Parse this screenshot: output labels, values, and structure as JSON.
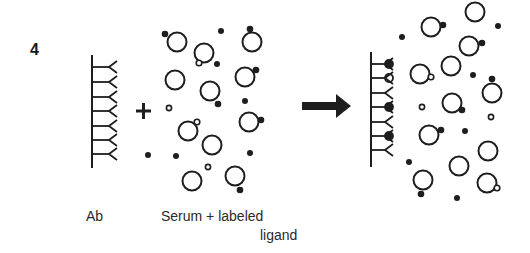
{
  "figure": {
    "panel_number": "4",
    "labels": {
      "antibody": "Ab",
      "serum_line1": "Serum + labeled",
      "serum_line2": "ligand"
    },
    "plus_symbol": "+",
    "arrow": "reaction-arrow",
    "colors": {
      "ink": "#1e1e1e",
      "text": "#2a2a2a",
      "background": "#ffffff"
    }
  },
  "antibody_left": {
    "x": 92,
    "y_top": 55,
    "y_bottom": 168,
    "arms_y": [
      67,
      82,
      97,
      111,
      126,
      140,
      154
    ],
    "arm_length": 25,
    "bound": [
      null,
      null,
      null,
      null,
      null,
      null,
      null
    ]
  },
  "antibody_right": {
    "x": 371,
    "y_top": 52,
    "y_bottom": 167,
    "arms_y": [
      64,
      78,
      93,
      107,
      122,
      136,
      150
    ],
    "arm_length": 22,
    "bound": [
      "labeled",
      "unlabeled",
      null,
      "labeled",
      null,
      "labeled",
      null
    ]
  },
  "middle_mix": {
    "proteins": [
      {
        "cx": 177,
        "cy": 42,
        "attach": {
          "x": 165,
          "y": 34,
          "type": "labeled"
        }
      },
      {
        "cx": 204,
        "cy": 53,
        "attach": {
          "x": 199,
          "y": 63,
          "type": "unlabeled"
        }
      },
      {
        "cx": 252,
        "cy": 42,
        "attach": {
          "x": 250,
          "y": 29,
          "type": "labeled"
        }
      },
      {
        "cx": 175,
        "cy": 80,
        "attach": null
      },
      {
        "cx": 210,
        "cy": 91,
        "attach": {
          "x": 218,
          "y": 104,
          "type": "labeled"
        }
      },
      {
        "cx": 245,
        "cy": 77,
        "attach": {
          "x": 256,
          "y": 70,
          "type": "labeled"
        }
      },
      {
        "cx": 188,
        "cy": 131,
        "attach": {
          "x": 197,
          "y": 122,
          "type": "unlabeled"
        }
      },
      {
        "cx": 212,
        "cy": 145,
        "attach": null
      },
      {
        "cx": 249,
        "cy": 122,
        "attach": {
          "x": 261,
          "y": 120,
          "type": "labeled"
        }
      },
      {
        "cx": 192,
        "cy": 181,
        "attach": null
      },
      {
        "cx": 235,
        "cy": 176,
        "attach": {
          "x": 240,
          "y": 190,
          "type": "labeled"
        }
      }
    ],
    "free_labeled": [
      [
        221,
        31
      ],
      [
        217,
        64
      ],
      [
        245,
        101
      ],
      [
        148,
        155
      ],
      [
        176,
        156
      ],
      [
        250,
        153
      ]
    ],
    "free_unlabeled": [
      [
        169,
        108
      ],
      [
        208,
        167
      ]
    ]
  },
  "right_mix": {
    "proteins": [
      {
        "cx": 475,
        "cy": 12,
        "attach": null
      },
      {
        "cx": 431,
        "cy": 27,
        "attach": {
          "x": 443,
          "y": 25,
          "type": "labeled"
        }
      },
      {
        "cx": 469,
        "cy": 46,
        "attach": {
          "x": 482,
          "y": 43,
          "type": "labeled"
        }
      },
      {
        "cx": 451,
        "cy": 66,
        "attach": null
      },
      {
        "cx": 420,
        "cy": 74,
        "attach": {
          "x": 431,
          "y": 77,
          "type": "unlabeled"
        }
      },
      {
        "cx": 492,
        "cy": 93,
        "attach": {
          "x": 492,
          "y": 79,
          "type": "labeled"
        }
      },
      {
        "cx": 452,
        "cy": 103,
        "attach": {
          "x": 462,
          "y": 110,
          "type": "labeled"
        }
      },
      {
        "cx": 429,
        "cy": 135,
        "attach": {
          "x": 441,
          "y": 130,
          "type": "labeled"
        }
      },
      {
        "cx": 488,
        "cy": 151,
        "attach": null
      },
      {
        "cx": 459,
        "cy": 166,
        "attach": null
      },
      {
        "cx": 423,
        "cy": 180,
        "attach": {
          "x": 421,
          "y": 194,
          "type": "labeled"
        }
      },
      {
        "cx": 487,
        "cy": 183,
        "attach": {
          "x": 497,
          "y": 188,
          "type": "unlabeled"
        }
      }
    ],
    "free_labeled": [
      [
        402,
        37
      ],
      [
        498,
        26
      ],
      [
        473,
        75
      ],
      [
        465,
        131
      ],
      [
        409,
        162
      ],
      [
        457,
        198
      ]
    ],
    "free_unlabeled": [
      [
        422,
        107
      ],
      [
        491,
        117
      ]
    ]
  }
}
